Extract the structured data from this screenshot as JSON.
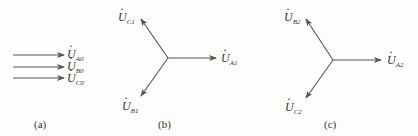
{
  "colors": {
    "stroke": "#555555",
    "text": "#333333"
  },
  "panels": [
    {
      "id": "a",
      "caption": "(a)",
      "vectors": [
        {
          "symbol": "U",
          "sub": "A0"
        },
        {
          "symbol": "U",
          "sub": "B0"
        },
        {
          "symbol": "U",
          "sub": "C0"
        }
      ]
    },
    {
      "id": "b",
      "caption": "(b)",
      "vectors": [
        {
          "symbol": "U",
          "sub": "A1"
        },
        {
          "symbol": "U",
          "sub": "B1"
        },
        {
          "symbol": "U",
          "sub": "C1"
        }
      ]
    },
    {
      "id": "c",
      "caption": "(c)",
      "vectors": [
        {
          "symbol": "U",
          "sub": "A2"
        },
        {
          "symbol": "U",
          "sub": "B2"
        },
        {
          "symbol": "U",
          "sub": "C2"
        }
      ]
    }
  ]
}
